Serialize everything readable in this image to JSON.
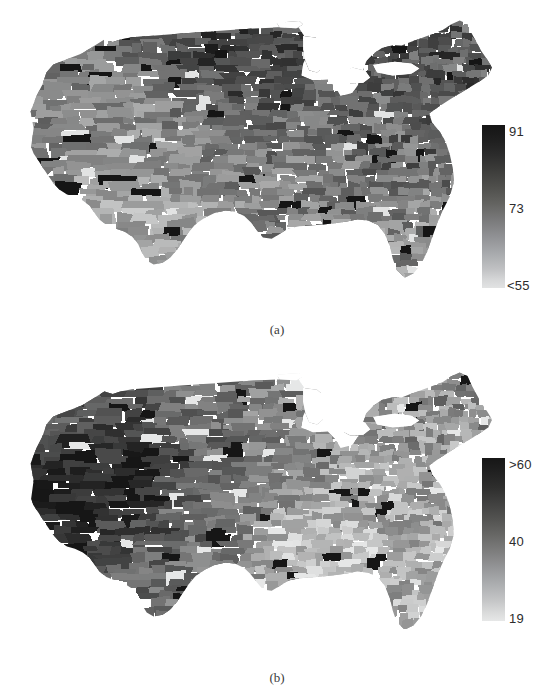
{
  "figure": {
    "kind": "two-panel-choropleth-map-figure",
    "background_color": "#ffffff",
    "width": 554,
    "height": 698
  },
  "chart_data": [
    {
      "type": "heatmap",
      "subtype": "choropleth",
      "panel_label": "(a)",
      "title": "",
      "subtitle": "",
      "xlabel": "",
      "ylabel": "",
      "geography": "United States counties (contiguous 48 states)",
      "projection": "albers-usa",
      "grid": false,
      "legend_position": "right",
      "colormap": "grayscale-reversed-dark-high",
      "colorbar": {
        "orientation": "vertical",
        "min_label": "<55",
        "mid_label": "73",
        "max_label": "91",
        "min_value": 55,
        "mid_value": 73,
        "max_value": 91,
        "dark_end": "high",
        "dark_color": "#151515",
        "light_color": "#e2e3e3",
        "ticks": [
          {
            "label": "91",
            "value": 91,
            "position": 1.0
          },
          {
            "label": "73",
            "value": 73,
            "position": 0.5
          },
          {
            "label": "<55",
            "value": 55,
            "position": 0.0
          }
        ]
      },
      "value_range": [
        55,
        91
      ],
      "regional_summary": [
        {
          "region": "Upper Midwest / Great Plains",
          "typical_value": 84,
          "shade": "dark"
        },
        {
          "region": "Northeast",
          "typical_value": 80,
          "shade": "medium-dark"
        },
        {
          "region": "Mountain West",
          "typical_value": 70,
          "shade": "medium-light"
        },
        {
          "region": "Southwest",
          "typical_value": 64,
          "shade": "light"
        },
        {
          "region": "Deep South",
          "typical_value": 72,
          "shade": "medium"
        },
        {
          "region": "Pacific Coast",
          "typical_value": 73,
          "shade": "medium"
        },
        {
          "region": "Appalachia",
          "typical_value": 77,
          "shade": "medium-dark"
        },
        {
          "region": "Florida",
          "typical_value": 70,
          "shade": "medium-light"
        }
      ]
    },
    {
      "type": "heatmap",
      "subtype": "choropleth",
      "panel_label": "(b)",
      "title": "",
      "subtitle": "",
      "xlabel": "",
      "ylabel": "",
      "geography": "United States counties (contiguous 48 states)",
      "projection": "albers-usa",
      "grid": false,
      "legend_position": "right",
      "colormap": "grayscale-reversed-dark-high",
      "colorbar": {
        "orientation": "vertical",
        "min_label": "19",
        "mid_label": "40",
        "max_label": ">60",
        "min_value": 19,
        "mid_value": 40,
        "max_value": 60,
        "dark_end": "high",
        "dark_color": "#161616",
        "light_color": "#e6e7e7",
        "ticks": [
          {
            "label": ">60",
            "value": 60,
            "position": 1.0
          },
          {
            "label": "40",
            "value": 40,
            "position": 0.5
          },
          {
            "label": "19",
            "value": 19,
            "position": 0.0
          }
        ]
      },
      "value_range": [
        19,
        60
      ],
      "regional_summary": [
        {
          "region": "Mountain West",
          "typical_value": 58,
          "shade": "very-dark"
        },
        {
          "region": "Great Basin / Nevada",
          "typical_value": 60,
          "shade": "very-dark"
        },
        {
          "region": "Pacific Northwest",
          "typical_value": 47,
          "shade": "medium-dark"
        },
        {
          "region": "Great Plains",
          "typical_value": 43,
          "shade": "medium"
        },
        {
          "region": "Upper Midwest",
          "typical_value": 38,
          "shade": "medium"
        },
        {
          "region": "Deep South",
          "typical_value": 26,
          "shade": "light"
        },
        {
          "region": "Northeast",
          "typical_value": 36,
          "shade": "medium-light"
        },
        {
          "region": "Appalachia",
          "typical_value": 30,
          "shade": "light"
        },
        {
          "region": "Florida",
          "typical_value": 30,
          "shade": "light"
        }
      ]
    }
  ],
  "panel_a": {
    "caption": "(a)",
    "colorbar_labels": {
      "top": "91",
      "middle": "73",
      "bottom": "<55"
    }
  },
  "panel_b": {
    "caption": "(b)",
    "colorbar_labels": {
      "top": ">60",
      "middle": "40",
      "bottom": "19"
    }
  }
}
